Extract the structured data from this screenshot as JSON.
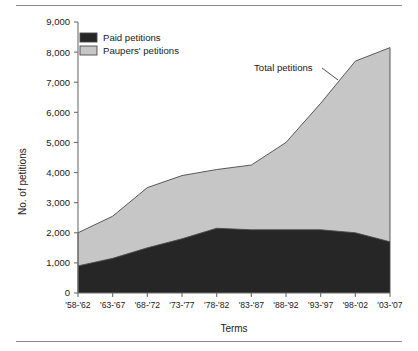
{
  "chart_data": {
    "type": "area",
    "stacked": true,
    "title": "",
    "xlabel": "Terms",
    "ylabel": "No. of petitions",
    "categories": [
      "'58-'62",
      "'63-'67",
      "'68-'72",
      "'73-'77",
      "'78-'82",
      "'83-'87",
      "'88-'92",
      "'93-'97",
      "'98-'02",
      "'03-'07"
    ],
    "series": [
      {
        "name": "Paid petitions",
        "color": "#262626",
        "values": [
          900,
          1150,
          1500,
          1800,
          2150,
          2100,
          2100,
          2100,
          2000,
          1700
        ]
      },
      {
        "name": "Paupers' petitions",
        "color": "#c6c6c6",
        "values": [
          1100,
          1400,
          2000,
          2100,
          1950,
          2150,
          2900,
          4200,
          5700,
          6450
        ]
      }
    ],
    "totals": [
      2000,
      2550,
      3500,
      3900,
      4100,
      4250,
      5000,
      6300,
      7700,
      8150
    ],
    "ylim": [
      0,
      9000
    ],
    "yticks": [
      0,
      1000,
      2000,
      3000,
      4000,
      5000,
      6000,
      7000,
      8000,
      9000
    ],
    "ytick_labels": [
      "0",
      "1,000",
      "2,000",
      "3,000",
      "4,000",
      "5,000",
      "6,000",
      "7,000",
      "8,000",
      "9,000"
    ],
    "grid": false,
    "legend": {
      "position": "top-left",
      "entries": [
        {
          "label": "Paid petitions",
          "color": "#262626"
        },
        {
          "label": "Paupers' petitions",
          "color": "#c6c6c6"
        }
      ]
    },
    "annotations": [
      {
        "text": "Total petitions",
        "target_category": "'93-'97"
      }
    ]
  },
  "axes": {
    "y_title": "No. of petitions",
    "x_title": "Terms"
  }
}
